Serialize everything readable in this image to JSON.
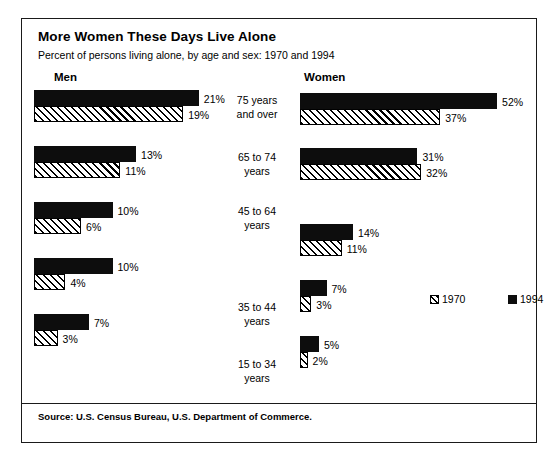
{
  "chart_data": {
    "type": "bar",
    "title": "More Women These Days Live Alone",
    "subtitle": "Percent of persons living alone, by age and sex:  1970 and 1994",
    "xlabel": "",
    "ylabel": "Percent of persons living alone",
    "orientation": "horizontal",
    "grid": false,
    "legend_position": "center-right",
    "panels": [
      "Men",
      "Women"
    ],
    "categories": [
      "75 years and over",
      "65 to 74 years",
      "45 to 64 years",
      "35 to 44 years",
      "15 to 34 years"
    ],
    "series": [
      {
        "name": "1970",
        "panel": "Men",
        "values": [
          19,
          11,
          6,
          4,
          3
        ],
        "fill": "hatched"
      },
      {
        "name": "1994",
        "panel": "Men",
        "values": [
          21,
          13,
          10,
          10,
          7
        ],
        "fill": "solid"
      },
      {
        "name": "1970",
        "panel": "Women",
        "values": [
          37,
          32,
          11,
          3,
          2
        ],
        "fill": "hatched"
      },
      {
        "name": "1994",
        "panel": "Women",
        "values": [
          52,
          31,
          14,
          7,
          5
        ],
        "fill": "solid"
      }
    ],
    "value_suffix": "%",
    "source": "Source:  U.S. Census Bureau, U.S. Department of Commerce."
  },
  "header": {
    "title": "More Women These Days Live Alone",
    "subtitle": "Percent of persons living alone, by age and sex:  1970 and 1994"
  },
  "panels": {
    "men_heading": "Men",
    "women_heading": "Women"
  },
  "age_labels": [
    {
      "line1": "75 years",
      "line2": "and over"
    },
    {
      "line1": "65 to 74",
      "line2": "years"
    },
    {
      "line1": "45 to 64",
      "line2": "years"
    },
    {
      "line1": "35 to 44",
      "line2": "years"
    },
    {
      "line1": "15 to 34",
      "line2": "years"
    }
  ],
  "men": {
    "rows": [
      {
        "new_value": "21%",
        "old_value": "19%"
      },
      {
        "new_value": "13%",
        "old_value": "11%"
      },
      {
        "new_value": "10%",
        "old_value": "6%"
      },
      {
        "new_value": "10%",
        "old_value": "4%"
      },
      {
        "new_value": "7%",
        "old_value": "3%"
      }
    ]
  },
  "women": {
    "rows": [
      {
        "new_value": "52%",
        "old_value": "37%"
      },
      {
        "new_value": "31%",
        "old_value": "32%"
      },
      {
        "new_value": "14%",
        "old_value": "11%"
      },
      {
        "new_value": "7%",
        "old_value": "3%"
      },
      {
        "new_value": "5%",
        "old_value": "2%"
      }
    ]
  },
  "legend": {
    "old_label": "1970",
    "new_label": "1994"
  },
  "footer": {
    "source": "Source:  U.S. Census Bureau, U.S. Department of Commerce."
  },
  "colors": {
    "solid_bar": "#0d0d0d",
    "hatch_line": "#000000",
    "frame": "#1a1a1a",
    "background": "#ffffff"
  }
}
